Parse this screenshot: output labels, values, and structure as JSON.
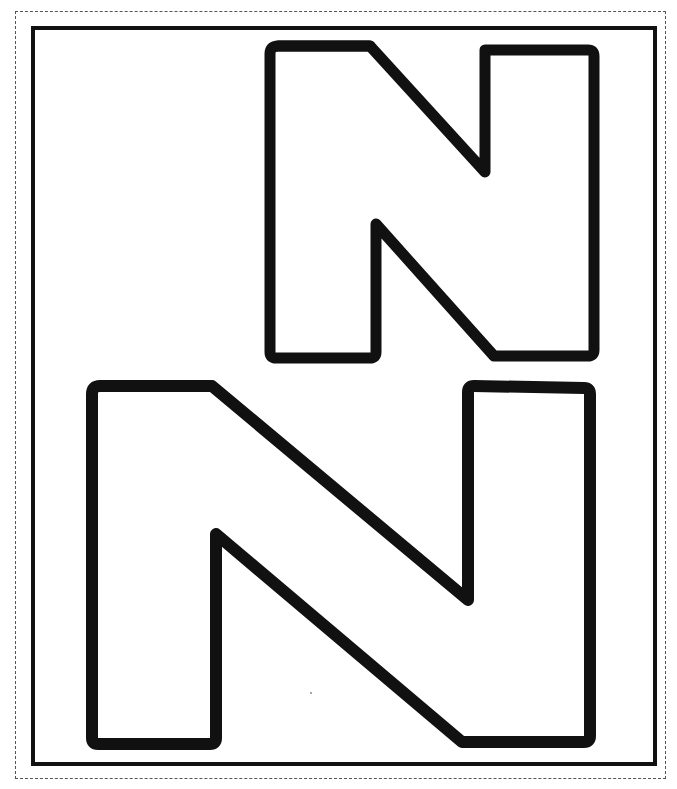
{
  "page": {
    "type": "printable letter coloring sheet",
    "background_color": "#ffffff",
    "stroke_color": "#111111",
    "border": {
      "outer": "dashed cut line",
      "inner": "solid frame"
    }
  },
  "letters": [
    {
      "id": "uppercase-n",
      "character": "N",
      "case": "uppercase",
      "style": "outline"
    },
    {
      "id": "lowercase-n-large",
      "character": "N",
      "case": "outline large",
      "style": "outline"
    }
  ]
}
